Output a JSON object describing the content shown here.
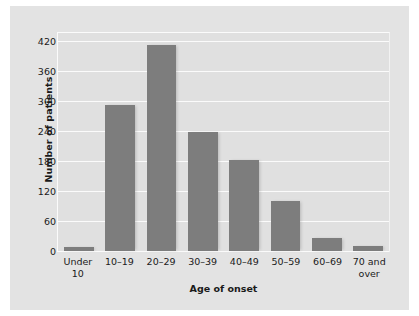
{
  "chart_data": {
    "type": "bar",
    "title": "",
    "xlabel": "Age of onset",
    "ylabel": "Number of patients",
    "categories": [
      "Under 10",
      "10–19",
      "20–29",
      "30–39",
      "40–49",
      "50–59",
      "60–69",
      "70 and over"
    ],
    "category_lines": [
      [
        "Under",
        "10"
      ],
      [
        "10–19"
      ],
      [
        "20–29"
      ],
      [
        "30–39"
      ],
      [
        "40–49"
      ],
      [
        "50–59"
      ],
      [
        "60–69"
      ],
      [
        "70 and",
        "over"
      ]
    ],
    "values": [
      8,
      295,
      415,
      240,
      183,
      100,
      25,
      10
    ],
    "ylim": [
      0,
      440
    ],
    "yticks": [
      0,
      60,
      120,
      180,
      240,
      300,
      360,
      420
    ],
    "ytick_labels": [
      "0",
      "60",
      "120",
      "180",
      "240",
      "300",
      "360",
      "420"
    ],
    "grid": "horizontal",
    "legend": "none",
    "colors": {
      "bar": "#7d7d7d",
      "plot_background": "#e0e0e0",
      "figure_background": "#e3e3e3",
      "gridline": "#fbfbfb",
      "text": "#1a1a1a"
    }
  }
}
